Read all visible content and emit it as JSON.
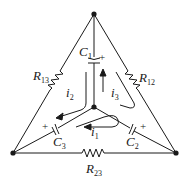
{
  "diagram": {
    "type": "circuit",
    "nodes": {
      "top": {
        "x": 94,
        "y": 14
      },
      "bottom_left": {
        "x": 13,
        "y": 153
      },
      "bottom_right": {
        "x": 176,
        "y": 153
      },
      "center": {
        "x": 94,
        "y": 107
      }
    },
    "components": {
      "C1": {
        "label": "C",
        "sub": "1",
        "polarity": "+"
      },
      "C2": {
        "label": "C",
        "sub": "2",
        "polarity": "+"
      },
      "C3": {
        "label": "C",
        "sub": "3",
        "polarity": "+"
      },
      "R12": {
        "label": "R",
        "sub": "12"
      },
      "R13": {
        "label": "R",
        "sub": "13"
      },
      "R23": {
        "label": "R",
        "sub": "23"
      }
    },
    "currents": {
      "i1": {
        "label": "i",
        "sub": "1"
      },
      "i2": {
        "label": "i",
        "sub": "2"
      },
      "i3": {
        "label": "i",
        "sub": "3"
      }
    },
    "colors": {
      "stroke": "#1a1a1a",
      "background": "#ffffff"
    }
  }
}
